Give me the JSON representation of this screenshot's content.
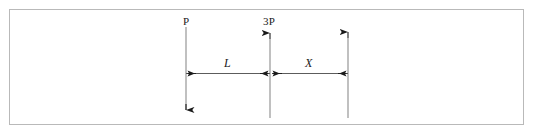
{
  "figure": {
    "type": "beam-load-diagram",
    "background_color": "#ffffff",
    "frame": {
      "border_color": "#b9b9b9",
      "x": 9,
      "y": 9,
      "width": 515,
      "height": 116
    },
    "line_color": "#8c8c8c",
    "arrow_color": "#1a1a1a",
    "text_color": "#1a1a1a"
  },
  "loads": [
    {
      "id": "load-p",
      "label": "P",
      "direction": "down",
      "x": 186,
      "line_top": 27,
      "line_bottom": 118
    },
    {
      "id": "load-3p",
      "label": "3P",
      "direction": "up",
      "x": 270,
      "line_top": 31,
      "line_bottom": 118
    },
    {
      "id": "load-reaction",
      "label": "",
      "direction": "up",
      "x": 348,
      "line_top": 30,
      "line_bottom": 118
    }
  ],
  "dimensions": [
    {
      "id": "dim-l",
      "label": "L",
      "from_x": 186,
      "to_x": 270,
      "y": 73
    },
    {
      "id": "dim-x",
      "label": "X",
      "from_x": 270,
      "to_x": 348,
      "y": 73
    }
  ]
}
